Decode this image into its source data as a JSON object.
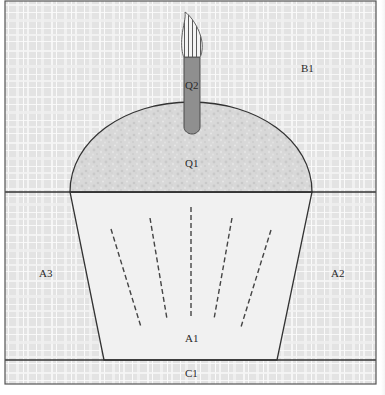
{
  "diagram": {
    "colors": {
      "background_plaid_base": "#e4e4e4",
      "background_plaid_light": "#f3f3f3",
      "background_plaid_white": "#fafafa",
      "dome_fill": "#d9d9d9",
      "dome_speckle": "#c6c6c6",
      "cup_fill": "#f1f1f1",
      "candle_fill": "#8f8f8f",
      "candle_stroke": "#4a4a4a",
      "flame_fill": "#f2f2f2",
      "flame_stripe": "#555555",
      "outline": "#333333",
      "label": "#2a2a2a"
    },
    "regions": [
      {
        "id": "B1",
        "label": "B1",
        "description": "Background above the cupcake (sky area)"
      },
      {
        "id": "Q1",
        "label": "Q1",
        "description": "Frosting dome of the cupcake"
      },
      {
        "id": "Q2",
        "label": "Q2",
        "description": "Candle stick"
      },
      {
        "id": "A1",
        "label": "A1",
        "description": "Cupcake wrapper (trapezoid with pleat lines)"
      },
      {
        "id": "A2",
        "label": "A2",
        "description": "Background to the right of the wrapper"
      },
      {
        "id": "A3",
        "label": "A3",
        "description": "Background to the left of the wrapper"
      },
      {
        "id": "C1",
        "label": "C1",
        "description": "Bottom strip / table surface"
      }
    ],
    "labels": {
      "B1": "B1",
      "Q1": "Q1",
      "Q2": "Q2",
      "A1": "A1",
      "A2": "A2",
      "A3": "A3",
      "C1": "C1"
    },
    "pleat_lines_count": 5
  }
}
